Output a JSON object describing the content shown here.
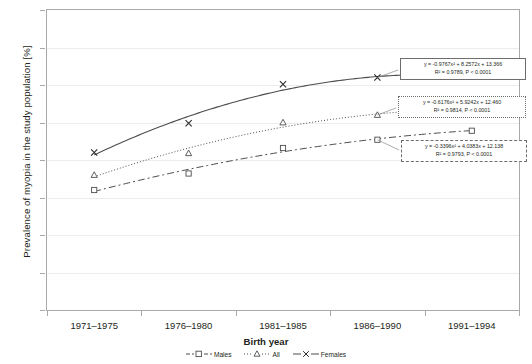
{
  "chart_data": {
    "type": "line",
    "title": "",
    "xlabel": "Birth year",
    "ylabel": "Prevalence of myopia in the study population [%]",
    "categories": [
      "1971–1975",
      "1976–1980",
      "1981–1985",
      "1986–1990",
      "1991–1994"
    ],
    "ylim": [
      0,
      40
    ],
    "y_ticks": [
      0,
      5,
      10,
      15,
      20,
      25,
      30,
      35,
      40
    ],
    "grid": true,
    "legend_position": "bottom",
    "series": [
      {
        "name": "Males",
        "marker": "square",
        "line": "dash-dot",
        "values": [
          16.0,
          18.2,
          21.6,
          22.7,
          23.9
        ]
      },
      {
        "name": "All",
        "marker": "triangle",
        "line": "dotted",
        "values": [
          18.0,
          20.9,
          25.0,
          26.0,
          26.8
        ]
      },
      {
        "name": "Females",
        "marker": "x",
        "line": "solid",
        "values": [
          21.0,
          24.9,
          30.1,
          31.0,
          31.2
        ]
      }
    ],
    "annotations": [
      {
        "series": "Females",
        "equation": "y = -0.9767x² + 8.2572x + 13.366",
        "stats": "R² = 0.9789, P < 0.0001",
        "coef_a": -0.9767,
        "coef_b": 8.2572,
        "coef_c": 13.366,
        "r2": 0.9789,
        "p": "< 0.0001"
      },
      {
        "series": "All",
        "equation": "y = -0.6176x² + 5.9242x + 12.460",
        "stats": "R² = 0.9814, P < 0.0001",
        "coef_a": -0.6176,
        "coef_b": 5.9242,
        "coef_c": 12.46,
        "r2": 0.9814,
        "p": "< 0.0001"
      },
      {
        "series": "Males",
        "equation": "y = -0.3396x² + 4.0383x + 12.138",
        "stats": "R² = 0.9793, P < 0.0001",
        "coef_a": -0.3396,
        "coef_b": 4.0383,
        "coef_c": 12.138,
        "r2": 0.9793,
        "p": "< 0.0001"
      }
    ]
  },
  "axes": {
    "y_title": "Prevalence of myopia in the study population [%]",
    "x_title": "Birth year",
    "y_labels": [
      "40",
      "35",
      "30",
      "25",
      "20",
      "15",
      "10",
      "5",
      "0"
    ],
    "x_labels": [
      "1971–1975",
      "1976–1980",
      "1981–1985",
      "1986–1990",
      "1991–1994"
    ]
  },
  "legend": {
    "items": [
      {
        "label": "Males",
        "marker": "square-marker"
      },
      {
        "label": "All",
        "marker": "triangle-marker"
      },
      {
        "label": "Females",
        "marker": "x-marker"
      }
    ]
  },
  "equation_boxes": [
    {
      "eq": "y = -0.9767x² + 8.2572x + 13.366",
      "r2": "R² = 0.9789, P < 0.0001"
    },
    {
      "eq": "y = -0.6176x² + 5.9242x + 12.460",
      "r2": "R² = 0.9814, P < 0.0001"
    },
    {
      "eq": "y = -0.3396x² + 4.0383x + 12.138",
      "r2": "R² = 0.9793, P < 0.0001"
    }
  ],
  "colors": {
    "line": "#4d4d4d",
    "axis": "#a9a9a9",
    "grid": "#ececec",
    "text": "#231f20"
  }
}
